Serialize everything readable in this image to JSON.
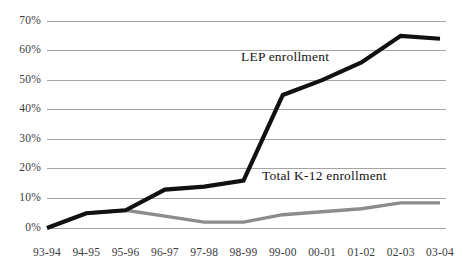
{
  "chart_data": {
    "type": "line",
    "title": "",
    "xlabel": "",
    "ylabel": "",
    "ylim": [
      0,
      70
    ],
    "grid": true,
    "legend_position": "inline-annotations",
    "categories": [
      "93-94",
      "94-95",
      "95-96",
      "96-97",
      "97-98",
      "98-99",
      "99-00",
      "00-01",
      "01-02",
      "02-03",
      "03-04"
    ],
    "ytick_labels": [
      "70%",
      "60%",
      "50%",
      "40%",
      "30%",
      "20%",
      "10%",
      "0%"
    ],
    "ytick_values": [
      70,
      60,
      50,
      40,
      30,
      20,
      10,
      0
    ],
    "series": [
      {
        "name": "LEP enrollment",
        "color": "#111111",
        "values": [
          0,
          5,
          6,
          13,
          14,
          16,
          45,
          50,
          56,
          65,
          64
        ]
      },
      {
        "name": "Total K-12 enrollment",
        "color": "#8c8c8c",
        "values": [
          0,
          5,
          6,
          4,
          2,
          2,
          4.5,
          5.5,
          6.5,
          8.5,
          8.5
        ]
      }
    ],
    "annotations": [
      {
        "text": "LEP enrollment",
        "x_px": 241,
        "y_px": 57
      },
      {
        "text": "Total K-12 enrollment",
        "x_px": 262,
        "y_px": 176
      }
    ],
    "colors": {
      "gridline": "#9a9a9a",
      "lep_line": "#111111",
      "total_line": "#8c8c8c",
      "tick_text": "#3b3b3b",
      "background": "#ffffff"
    }
  }
}
